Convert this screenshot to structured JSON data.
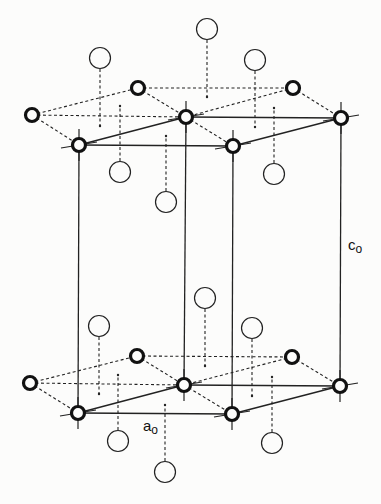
{
  "labels": {
    "c_axis": {
      "main": "c",
      "sub": "o"
    },
    "a_axis": {
      "main": "a",
      "sub": "o"
    }
  },
  "colors": {
    "line": "#222222",
    "background": "#fcfcfb"
  },
  "layers": [
    {
      "name": "top",
      "lattice_atoms": [
        [
          32,
          115
        ],
        [
          138,
          88
        ],
        [
          293,
          88
        ],
        [
          186,
          117
        ],
        [
          341,
          118
        ],
        [
          79,
          145
        ],
        [
          233,
          146
        ]
      ],
      "interstitial_atoms": [
        {
          "circle": [
            100,
            58
          ],
          "stem_end": [
            100,
            126
          ]
        },
        {
          "circle": [
            207,
            29
          ],
          "stem_end": [
            207,
            97
          ]
        },
        {
          "circle": [
            255,
            60
          ],
          "stem_end": [
            255,
            127
          ]
        },
        {
          "circle": [
            120,
            172
          ],
          "stem_end": [
            120,
            106
          ]
        },
        {
          "circle": [
            166,
            202
          ],
          "stem_end": [
            166,
            136
          ]
        },
        {
          "circle": [
            274,
            174
          ],
          "stem_end": [
            274,
            108
          ]
        }
      ]
    },
    {
      "name": "bottom",
      "lattice_atoms": [
        [
          30,
          383
        ],
        [
          137,
          356
        ],
        [
          292,
          357
        ],
        [
          184,
          385
        ],
        [
          340,
          386
        ],
        [
          78,
          413
        ],
        [
          232,
          414
        ]
      ],
      "interstitial_atoms": [
        {
          "circle": [
            99,
            326
          ],
          "stem_end": [
            99,
            394
          ]
        },
        {
          "circle": [
            205,
            298
          ],
          "stem_end": [
            205,
            366
          ]
        },
        {
          "circle": [
            252,
            328
          ],
          "stem_end": [
            252,
            396
          ]
        },
        {
          "circle": [
            118,
            441
          ],
          "stem_end": [
            118,
            375
          ]
        },
        {
          "circle": [
            165,
            472
          ],
          "stem_end": [
            165,
            405
          ]
        },
        {
          "circle": [
            272,
            443
          ],
          "stem_end": [
            272,
            377
          ]
        }
      ]
    }
  ]
}
